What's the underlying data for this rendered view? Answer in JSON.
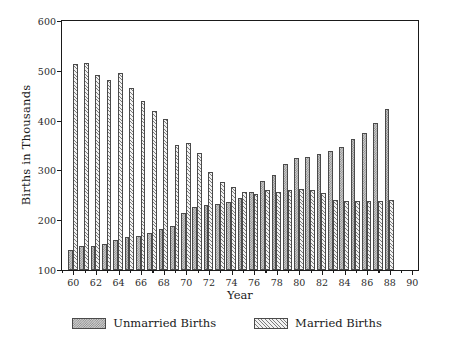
{
  "chart_data": {
    "type": "bar",
    "title": "",
    "xlabel": "Year",
    "ylabel": "Births in Thousands",
    "xlim": [
      59,
      90.5
    ],
    "ylim": [
      100,
      600
    ],
    "ytick_values": [
      100,
      200,
      300,
      400,
      500,
      600
    ],
    "ytick_labels": [
      "100",
      "200",
      "300",
      "400",
      "500",
      "600"
    ],
    "xtick_values": [
      60,
      62,
      64,
      66,
      68,
      70,
      72,
      74,
      76,
      78,
      80,
      82,
      84,
      86,
      88,
      90
    ],
    "xtick_labels": [
      "60",
      "62",
      "64",
      "66",
      "68",
      "70",
      "72",
      "74",
      "76",
      "78",
      "80",
      "82",
      "84",
      "86",
      "88",
      "90"
    ],
    "grid": false,
    "legend_position": "bottom-center",
    "bar_baseline": 100,
    "categories": [
      60,
      61,
      62,
      63,
      64,
      65,
      66,
      67,
      68,
      69,
      70,
      71,
      72,
      73,
      74,
      75,
      76,
      77,
      78,
      79,
      80,
      81,
      82,
      83,
      84,
      85,
      86,
      87,
      88
    ],
    "series": [
      {
        "name": "Unmarried Births",
        "pattern": "dotted",
        "fill": "#cfcfcf",
        "values": [
          141,
          148,
          149,
          152,
          160,
          166,
          169,
          175,
          183,
          188,
          214,
          226,
          231,
          233,
          237,
          245,
          257,
          278,
          291,
          313,
          324,
          326,
          333,
          338,
          348,
          363,
          376,
          396,
          424
        ]
      },
      {
        "name": "Married Births",
        "pattern": "diagonal-hatch",
        "fill": "#f2f2f2",
        "values": [
          514,
          516,
          491,
          482,
          496,
          466,
          440,
          419,
          403,
          352,
          356,
          334,
          297,
          276,
          266,
          256,
          253,
          260,
          257,
          260,
          262,
          261,
          254,
          241,
          238,
          238,
          238,
          239,
          241
        ]
      }
    ]
  },
  "legend": {
    "entries": [
      {
        "label": "Unmarried Births"
      },
      {
        "label": "Married Births"
      }
    ]
  },
  "axes": {
    "y_title": "Births in Thousands",
    "x_title": "Year"
  }
}
